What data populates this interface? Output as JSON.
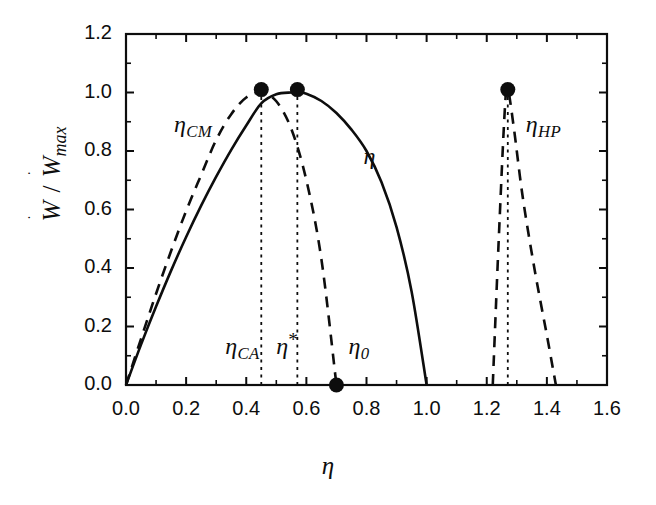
{
  "chart_data": {
    "type": "line",
    "title": "",
    "xlabel": "η",
    "ylabel": "Ẇ / Ẇmax",
    "xlim": [
      0.0,
      1.6
    ],
    "ylim": [
      0.0,
      1.2
    ],
    "xticks": [
      "0.0",
      "0.2",
      "0.4",
      "0.6",
      "0.8",
      "1.0",
      "1.2",
      "1.4",
      "1.6"
    ],
    "xtick_values": [
      0.0,
      0.2,
      0.4,
      0.6,
      0.8,
      1.0,
      1.2,
      1.4,
      1.6
    ],
    "yticks": [
      "0.0",
      "0.2",
      "0.4",
      "0.6",
      "0.8",
      "1.0",
      "1.2"
    ],
    "ytick_values": [
      0.0,
      0.2,
      0.4,
      0.6,
      0.8,
      1.0,
      1.2
    ],
    "grid": false,
    "legend": "inline-annotations",
    "series": [
      {
        "name": "η",
        "style": "solid",
        "description": "Endoreversible power output curve, parabolic, zero at η=0 and η=1.0, maximum 1.0 at η=0.57",
        "x": [
          0.0,
          0.05,
          0.1,
          0.15,
          0.2,
          0.25,
          0.3,
          0.35,
          0.4,
          0.45,
          0.5,
          0.55,
          0.57,
          0.6,
          0.65,
          0.7,
          0.75,
          0.8,
          0.85,
          0.9,
          0.95,
          1.0
        ],
        "y": [
          0.0,
          0.138,
          0.268,
          0.391,
          0.506,
          0.613,
          0.712,
          0.804,
          0.887,
          0.963,
          0.994,
          1.0,
          1.0,
          0.996,
          0.971,
          0.93,
          0.873,
          0.8,
          0.693,
          0.54,
          0.32,
          0.0
        ]
      },
      {
        "name": "ηCM",
        "style": "dashed",
        "description": "Omega / CM criterion curve, zero at η=0 and η=0.70, maximum 1.0 at η=0.45",
        "x": [
          0.0,
          0.05,
          0.1,
          0.15,
          0.2,
          0.25,
          0.3,
          0.35,
          0.4,
          0.45,
          0.5,
          0.55,
          0.6,
          0.65,
          0.7
        ],
        "y": [
          0.0,
          0.158,
          0.312,
          0.458,
          0.595,
          0.718,
          0.838,
          0.926,
          0.983,
          1.0,
          0.97,
          0.875,
          0.7,
          0.43,
          0.0
        ]
      },
      {
        "name": "ηHP",
        "style": "dashed",
        "description": "Heat-pump branch, narrow spike peaking at η=1.27 with value 1.01, feet at η=1.22 and η=1.43",
        "x": [
          1.22,
          1.24,
          1.26,
          1.27,
          1.29,
          1.32,
          1.36,
          1.4,
          1.43
        ],
        "y": [
          0.0,
          0.5,
          0.94,
          1.01,
          0.88,
          0.64,
          0.39,
          0.17,
          0.0
        ]
      }
    ],
    "markers": [
      {
        "name": "eta-CA-peak",
        "x": 0.45,
        "y": 1.01,
        "label": "ηCA"
      },
      {
        "name": "eta-star-peak",
        "x": 0.57,
        "y": 1.01,
        "label": "η*"
      },
      {
        "name": "eta-zero-point",
        "x": 0.7,
        "y": 0.0,
        "label": "η0"
      },
      {
        "name": "eta-HP-peak",
        "x": 1.27,
        "y": 1.01,
        "label": "ηHP"
      }
    ],
    "dotted_verticals": [
      {
        "name": "eta-CA-dropline",
        "x": 0.45,
        "y_top": 1.01,
        "y_bottom": 0.0
      },
      {
        "name": "eta-star-dropline",
        "x": 0.57,
        "y_top": 1.01,
        "y_bottom": 0.0
      },
      {
        "name": "eta-HP-dropline",
        "x": 1.27,
        "y_top": 1.01,
        "y_bottom": 0.0
      }
    ],
    "annotations": [
      {
        "name": "eta-cm-label",
        "text": "η",
        "sub": "CM",
        "x": 0.16,
        "y": 0.88
      },
      {
        "name": "eta-label",
        "text": "η",
        "sub": "",
        "x": 0.79,
        "y": 0.77
      },
      {
        "name": "eta-hp-label",
        "text": "η",
        "sub": "HP",
        "x": 1.33,
        "y": 0.88
      },
      {
        "name": "eta-ca-label",
        "text": "η",
        "sub": "CA",
        "x": 0.33,
        "y": 0.12
      },
      {
        "name": "eta-star-label",
        "text": "η",
        "sub": "*",
        "x": 0.5,
        "y": 0.12
      },
      {
        "name": "eta-zero-label",
        "text": "η",
        "sub": "0",
        "x": 0.74,
        "y": 0.12
      }
    ],
    "colors": {
      "ink": "#0d0d0d",
      "background": "#ffffff"
    }
  },
  "axis": {
    "x_title": "η",
    "y_title_main": "W / Wmax"
  }
}
